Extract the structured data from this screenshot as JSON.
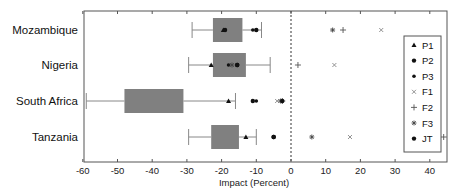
{
  "chart_data": {
    "type": "box",
    "orientation": "horizontal",
    "title": "",
    "xlabel": "Impact (Percent)",
    "ylabel": "",
    "xlim": [
      -60,
      45
    ],
    "xticks": [
      -60,
      -50,
      -40,
      -30,
      -20,
      -10,
      0,
      10,
      20,
      30,
      40
    ],
    "reference_line": {
      "x": 0,
      "style": "dashed"
    },
    "grid": false,
    "legend_position": "right-inside",
    "categories": [
      "Mozambique",
      "Nigeria",
      "South Africa",
      "Tanzania"
    ],
    "boxes": [
      {
        "category": "Mozambique",
        "whisker_low": -28.5,
        "q1": -22.5,
        "q3": -14,
        "whisker_high": -8.5
      },
      {
        "category": "Nigeria",
        "whisker_low": -29.5,
        "q1": -22.5,
        "q3": -13,
        "whisker_high": -6
      },
      {
        "category": "South Africa",
        "whisker_low": -59,
        "q1": -48,
        "q3": -31,
        "whisker_high": -16
      },
      {
        "category": "Tanzania",
        "whisker_low": -29.5,
        "q1": -23,
        "q3": -15,
        "whisker_high": -10
      }
    ],
    "series": [
      {
        "name": "P1",
        "marker": "triangle",
        "values": [
          -19.5,
          -23,
          -18,
          -13
        ]
      },
      {
        "name": "P2",
        "marker": "dot",
        "values": [
          -19,
          -15.5,
          -11,
          -5
        ]
      },
      {
        "name": "P3",
        "marker": "dot-small",
        "values": [
          -11,
          -18,
          -10,
          -5
        ]
      },
      {
        "name": "F1",
        "marker": "x",
        "values": [
          26,
          12.5,
          -4,
          17
        ]
      },
      {
        "name": "F2",
        "marker": "plus",
        "values": [
          15,
          2,
          -2.5,
          44
        ]
      },
      {
        "name": "F3",
        "marker": "star",
        "values": [
          12,
          -17,
          -3,
          6
        ]
      },
      {
        "name": "JT",
        "marker": "dot",
        "values": [
          -10,
          -15.5,
          -2.5,
          -5
        ]
      }
    ],
    "colors": {
      "box_fill": "#808080",
      "whisker": "#888888",
      "marker": "#111111",
      "axis": "#555555"
    }
  },
  "legend": {
    "items": [
      {
        "label": "P1",
        "glyph": "▲"
      },
      {
        "label": "P2",
        "glyph": "●"
      },
      {
        "label": "P3",
        "glyph": "●"
      },
      {
        "label": "F1",
        "glyph": "×"
      },
      {
        "label": "F2",
        "glyph": "+"
      },
      {
        "label": "F3",
        "glyph": "✱"
      },
      {
        "label": "JT",
        "glyph": "●"
      }
    ]
  }
}
